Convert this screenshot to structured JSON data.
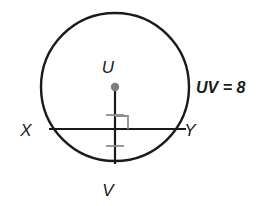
{
  "figure": {
    "type": "circle-geometry-diagram",
    "background_color": "#ffffff",
    "stroke_color": "#1a1a1a",
    "accent_color": "#8c8c8c",
    "circle": {
      "name": "circle-u",
      "center_x": 115,
      "center_y": 87,
      "radius": 74,
      "stroke_width": 2.4
    },
    "center_point": {
      "name": "center-point-u",
      "x": 115,
      "y": 87,
      "radius": 4.2,
      "color": "#7d7d7d"
    },
    "radius_segment": {
      "name": "segment-uv",
      "x1": 115,
      "y1": 87,
      "x2": 115,
      "y2": 164,
      "stroke_width": 2.2
    },
    "chord_segment": {
      "name": "segment-xy",
      "x1": 49,
      "y1": 129,
      "x2": 186,
      "y2": 129,
      "stroke_width": 2.2
    },
    "right_angle_marker": {
      "name": "right-angle-marker",
      "x": 115,
      "y": 129,
      "size": 13,
      "color": "#8c8c8c",
      "stroke_width": 1.8
    },
    "tick_marks": [
      {
        "name": "congruence-tick-upper",
        "cx": 115,
        "cy": 115,
        "half_width": 9,
        "color": "#8c8c8c",
        "stroke_width": 1.8
      },
      {
        "name": "congruence-tick-lower",
        "cx": 115,
        "cy": 146,
        "half_width": 9,
        "color": "#8c8c8c",
        "stroke_width": 1.8
      }
    ],
    "labels": [
      {
        "name": "label-u",
        "text": "U",
        "x": 108,
        "y": 73,
        "class": "vertex-label"
      },
      {
        "name": "label-x",
        "text": "X",
        "x": 26,
        "y": 136,
        "class": "vertex-label"
      },
      {
        "name": "label-y",
        "text": "Y",
        "x": 190,
        "y": 136,
        "class": "vertex-label"
      },
      {
        "name": "label-v",
        "text": "V",
        "x": 108,
        "y": 196,
        "class": "vertex-label"
      },
      {
        "name": "label-uv-measure",
        "text": "UV = 8",
        "x": 196,
        "y": 93,
        "class": "measure-label"
      }
    ]
  }
}
